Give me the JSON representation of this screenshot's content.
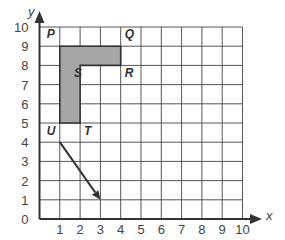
{
  "diagram": {
    "type": "coordinate-grid",
    "axes": {
      "x_label": "x",
      "y_label": "y",
      "x_ticks": [
        "0",
        "1",
        "2",
        "3",
        "4",
        "5",
        "6",
        "7",
        "8",
        "9",
        "10"
      ],
      "y_ticks": [
        "0",
        "1",
        "2",
        "3",
        "4",
        "5",
        "6",
        "7",
        "8",
        "9",
        "10"
      ]
    },
    "points": [
      {
        "label": "P",
        "x": 1,
        "y": 9
      },
      {
        "label": "Q",
        "x": 4,
        "y": 9
      },
      {
        "label": "R",
        "x": 4,
        "y": 8
      },
      {
        "label": "S",
        "x": 2,
        "y": 8
      },
      {
        "label": "T",
        "x": 2,
        "y": 5
      },
      {
        "label": "U",
        "x": 1,
        "y": 5
      }
    ],
    "shape": {
      "name": "PQRSTU",
      "vertices": [
        [
          1,
          9
        ],
        [
          4,
          9
        ],
        [
          4,
          8
        ],
        [
          2,
          8
        ],
        [
          2,
          5
        ],
        [
          1,
          5
        ]
      ],
      "fill": "#a6a6a6"
    },
    "vector": {
      "from": [
        1,
        4
      ],
      "to": [
        3,
        1
      ]
    }
  }
}
